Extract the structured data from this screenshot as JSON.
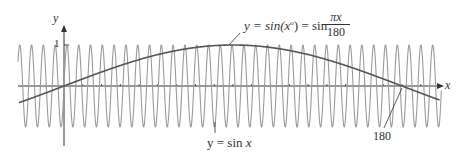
{
  "chart_data": {
    "type": "line",
    "title": "",
    "xlabel": "x",
    "ylabel": "y",
    "x_range": [
      -24,
      200
    ],
    "y_range": [
      -1.4,
      1.4
    ],
    "grid": false,
    "ticks": {
      "y": [
        {
          "value": 1,
          "label": "1"
        }
      ],
      "x_labeled": [
        {
          "value": 180,
          "label": "180"
        }
      ]
    },
    "series": [
      {
        "name": "y = sin x",
        "function": "sin(x)",
        "color": "#9a9a9a",
        "x_start": -24.5,
        "x_end": 201
      },
      {
        "name": "y = sin(x°) = sin πx/180",
        "function": "sin(pi*x/180)",
        "color": "#555555",
        "x_start": -24,
        "x_end": 200
      }
    ],
    "annotations": [
      {
        "text": "y = sin(x°) = sin πx/180",
        "points_to_x": 90
      },
      {
        "text": "y = sin x",
        "points_to_x": 90
      },
      {
        "text": "180",
        "points_to_x": 180
      }
    ]
  },
  "labels": {
    "y_axis": "y",
    "x_axis": "x",
    "y_tick_1": "1",
    "sin_deg_lhs": "y = sin(x",
    "sin_deg_sup": "o",
    "sin_deg_mid": ") = sin",
    "frac_num": "πx",
    "frac_den": "180",
    "sin_x_pre": "y = sin ",
    "sin_x_var": "x",
    "label_180": "180"
  },
  "colors": {
    "axis": "#333333",
    "fast_curve": "#9a9a9a",
    "slow_curve": "#555555"
  }
}
